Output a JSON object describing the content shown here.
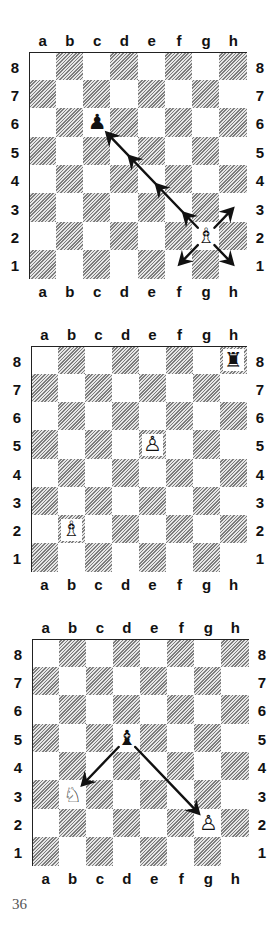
{
  "page": {
    "number": "36"
  },
  "files": [
    "a",
    "b",
    "c",
    "d",
    "e",
    "f",
    "g",
    "h"
  ],
  "ranks": [
    "8",
    "7",
    "6",
    "5",
    "4",
    "3",
    "2",
    "1"
  ],
  "colors": {
    "border": "#222222",
    "arrow": "#111111",
    "hatch_dark": "#7d7d7d",
    "hatch_light": "#e6e6e6",
    "label": "#111111",
    "page_number": "#555555"
  },
  "diagrams": [
    {
      "id": "diagram-1",
      "board": {
        "left": 29,
        "top": 52,
        "width": 218,
        "height": 227
      },
      "top_labels_y": 33,
      "bottom_labels_y": 284,
      "pieces": [
        {
          "square": "c6",
          "type": "pawn",
          "color": "black",
          "glyph": "♟"
        },
        {
          "square": "g2",
          "type": "bishop",
          "color": "white",
          "glyph": "♗"
        }
      ],
      "arrows": [
        {
          "from": "g2",
          "to": "c6",
          "style": "multi-head",
          "heads_at": [
            "f3",
            "e4",
            "d5",
            "c6"
          ]
        },
        {
          "from": "g2",
          "to": "h3",
          "style": "single"
        },
        {
          "from": "g2",
          "to": "f1",
          "style": "single"
        },
        {
          "from": "g2",
          "to": "h1",
          "style": "single"
        }
      ]
    },
    {
      "id": "diagram-2",
      "board": {
        "left": 31,
        "top": 346,
        "width": 216,
        "height": 226
      },
      "top_labels_y": 327,
      "bottom_labels_y": 577,
      "pieces": [
        {
          "square": "h8",
          "type": "rook",
          "color": "black",
          "glyph": "♜"
        },
        {
          "square": "e5",
          "type": "pawn",
          "color": "white",
          "glyph": "♙"
        },
        {
          "square": "b2",
          "type": "bishop",
          "color": "white",
          "glyph": "♗"
        }
      ],
      "arrows": []
    },
    {
      "id": "diagram-3",
      "board": {
        "left": 32,
        "top": 639,
        "width": 217,
        "height": 227
      },
      "top_labels_y": 620,
      "bottom_labels_y": 871,
      "pieces": [
        {
          "square": "d5",
          "type": "bishop",
          "color": "black",
          "glyph": "♝"
        },
        {
          "square": "b3",
          "type": "knight",
          "color": "white",
          "glyph": "♘"
        },
        {
          "square": "g2",
          "type": "pawn",
          "color": "white",
          "glyph": "♙"
        }
      ],
      "arrows": [
        {
          "from": "d5",
          "to": "b3",
          "style": "single"
        },
        {
          "from": "d5",
          "to": "g2",
          "style": "single"
        }
      ]
    }
  ]
}
